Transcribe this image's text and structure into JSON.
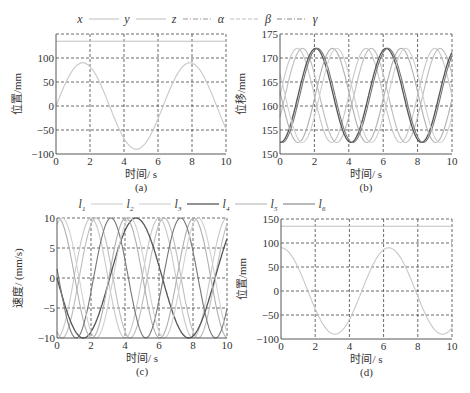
{
  "legend_top": {
    "entries": [
      {
        "label": "x",
        "style": "solid",
        "color": "#bdbdbd"
      },
      {
        "label": "y",
        "style": "solid",
        "color": "#bdbdbd"
      },
      {
        "label": "z",
        "style": "dashdot",
        "color": "#999999"
      },
      {
        "label": "α",
        "style": "dashed",
        "color": "#bdbdbd"
      },
      {
        "label": "β",
        "style": "dashdot",
        "color": "#888888"
      },
      {
        "label": "γ",
        "style": "none",
        "color": "#888888"
      }
    ]
  },
  "legend_mid": {
    "entries": [
      {
        "label": "l",
        "sub": "1",
        "style": "solid",
        "color": "#c8c8c8"
      },
      {
        "label": "l",
        "sub": "2",
        "style": "solid",
        "color": "#c8c8c8"
      },
      {
        "label": "l",
        "sub": "3",
        "style": "solid",
        "color": "#555555"
      },
      {
        "label": "l",
        "sub": "4",
        "style": "solid",
        "color": "#b0b0b0"
      },
      {
        "label": "l",
        "sub": "5",
        "style": "solid",
        "color": "#777777"
      },
      {
        "label": "l",
        "sub": "6",
        "style": "none",
        "color": "#777777"
      }
    ]
  },
  "caption": "",
  "chart_data": [
    {
      "id": "a",
      "type": "line",
      "panel_label": "(a)",
      "xlabel": "时间/ s",
      "ylabel": "位置/mm",
      "xlim": [
        0,
        10
      ],
      "ylim": [
        -100,
        150
      ],
      "xticks": [
        0,
        2,
        4,
        6,
        8,
        10
      ],
      "yticks": [
        -100,
        -50,
        0,
        50,
        100
      ],
      "grid": true,
      "box": {
        "x0": 56,
        "y0": 34,
        "x1": 226,
        "y1": 154
      },
      "series": [
        {
          "name": "constant ~135",
          "color": "#c0c0c0",
          "kind": "const",
          "value": 135
        },
        {
          "name": "sine",
          "color": "#c8c8c8",
          "kind": "sin",
          "amp": 90,
          "offset": 0,
          "period": 6.3,
          "phase": 0
        }
      ]
    },
    {
      "id": "b",
      "type": "line",
      "panel_label": "(b)",
      "xlabel": "时间/ s",
      "ylabel": "位移/mm",
      "xlim": [
        0,
        10
      ],
      "ylim": [
        150,
        175
      ],
      "xticks": [
        0,
        2,
        4,
        6,
        8,
        10
      ],
      "yticks": [
        150,
        155,
        160,
        165,
        170,
        175
      ],
      "grid": true,
      "box": {
        "x0": 280,
        "y0": 34,
        "x1": 452,
        "y1": 154
      },
      "series": [
        {
          "name": "l1",
          "color": "#c8c8c8",
          "kind": "sin",
          "amp": 9.8,
          "offset": 162.2,
          "period": 4.0,
          "phase": 0.0
        },
        {
          "name": "l2",
          "color": "#bdbdbd",
          "kind": "sin",
          "amp": 9.8,
          "offset": 162.2,
          "period": 4.0,
          "phase": 0.3
        },
        {
          "name": "l3",
          "color": "#555555",
          "kind": "sin",
          "amp": 9.8,
          "offset": 162.2,
          "period": 4.1,
          "phase": 1.05
        },
        {
          "name": "l4",
          "color": "#b0b0b0",
          "kind": "sin",
          "amp": 9.8,
          "offset": 162.2,
          "period": 4.0,
          "phase": 2.05
        },
        {
          "name": "l5",
          "color": "#777777",
          "kind": "sin",
          "amp": 9.8,
          "offset": 162.2,
          "period": 4.1,
          "phase": 1.15
        },
        {
          "name": "l6",
          "color": "#d0d0d0",
          "kind": "sin",
          "amp": 9.8,
          "offset": 162.2,
          "period": 4.0,
          "phase": 2.3
        }
      ]
    },
    {
      "id": "c",
      "type": "line",
      "panel_label": "(c)",
      "xlabel": "时间/ s",
      "ylabel": "速度/ (mm/s)",
      "xlim": [
        0,
        10
      ],
      "ylim": [
        -10,
        10
      ],
      "xticks": [
        0,
        2,
        4,
        6,
        8,
        10
      ],
      "yticks": [
        -10,
        -5,
        0,
        5,
        10
      ],
      "grid": true,
      "box": {
        "x0": 57,
        "y0": 218,
        "x1": 227,
        "y1": 338
      },
      "series": [
        {
          "name": "l1",
          "color": "#c8c8c8",
          "kind": "sin",
          "amp": 10,
          "offset": 0,
          "period": 4.0,
          "phase": 1.0
        },
        {
          "name": "l2",
          "color": "#bdbdbd",
          "kind": "sin",
          "amp": 10,
          "offset": 0,
          "period": 4.0,
          "phase": 1.3
        },
        {
          "name": "l3",
          "color": "#555555",
          "kind": "sin",
          "amp": 10,
          "offset": 0,
          "period": 6.2,
          "phase": 3.1
        },
        {
          "name": "l4",
          "color": "#b0b0b0",
          "kind": "sin",
          "amp": 10,
          "offset": 0,
          "period": 4.0,
          "phase": 3.05
        },
        {
          "name": "l5",
          "color": "#777777",
          "kind": "sin",
          "amp": 10,
          "offset": 0,
          "period": 4.1,
          "phase": 2.15
        },
        {
          "name": "l6",
          "color": "#d0d0d0",
          "kind": "sin",
          "amp": 10,
          "offset": 0,
          "period": 4.0,
          "phase": 3.3
        }
      ]
    },
    {
      "id": "d",
      "type": "line",
      "panel_label": "(d)",
      "xlabel": "时间/ s",
      "ylabel": "位置/mm",
      "xlim": [
        0,
        10
      ],
      "ylim": [
        -100,
        150
      ],
      "xticks": [
        0,
        2,
        4,
        6,
        8,
        10
      ],
      "yticks": [
        -100,
        -50,
        0,
        50,
        100,
        150
      ],
      "grid": true,
      "box": {
        "x0": 281,
        "y0": 219,
        "x1": 452,
        "y1": 339
      },
      "series": [
        {
          "name": "constant ~135",
          "color": "#c0c0c0",
          "kind": "const",
          "value": 135
        },
        {
          "name": "cosine",
          "color": "#c8c8c8",
          "kind": "sin",
          "amp": 90,
          "offset": 0,
          "period": 6.3,
          "phase": -1.575
        }
      ]
    }
  ]
}
